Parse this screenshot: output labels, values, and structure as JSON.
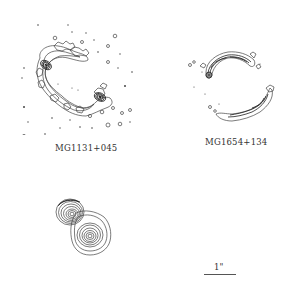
{
  "figure": {
    "panels": [
      {
        "id": "top-left",
        "source_name": "MG1131+045",
        "type": "radio contour map",
        "feature": "Einstein ring with two compact components"
      },
      {
        "id": "top-right",
        "source_name": "MG1654+134",
        "type": "radio contour map",
        "feature": "ring-shaped arc pair"
      },
      {
        "id": "bottom-left",
        "source_name": "",
        "type": "contour map",
        "feature": "two overlapping nested-contour peaks"
      },
      {
        "id": "bottom-right",
        "type": "scale bar",
        "scale_label": "1\""
      }
    ],
    "colors": {
      "background": "#ffffff",
      "contour": "#444444",
      "text": "#333333"
    }
  }
}
